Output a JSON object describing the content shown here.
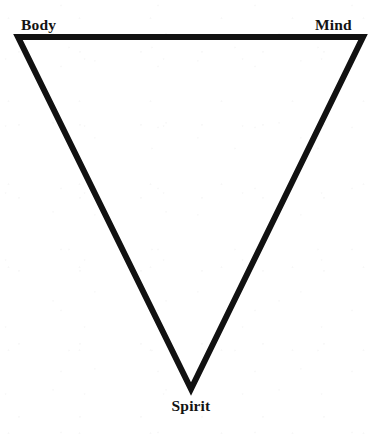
{
  "figure": {
    "name": "body-mind-spirit-triangle",
    "shape": "inverted-triangle",
    "background_color": "#ffffff",
    "stroke_color": "#111111",
    "stroke_width_px": 6,
    "label_color": "#131313",
    "vertices": [
      {
        "id": "top-left",
        "x": 18,
        "y": 37,
        "label": "Body"
      },
      {
        "id": "top-right",
        "x": 363,
        "y": 37,
        "label": "Mind"
      },
      {
        "id": "bottom",
        "x": 191,
        "y": 389,
        "label": "Spirit"
      }
    ],
    "labels": {
      "top_left": "Body",
      "top_right": "Mind",
      "bottom": "Spirit"
    }
  }
}
